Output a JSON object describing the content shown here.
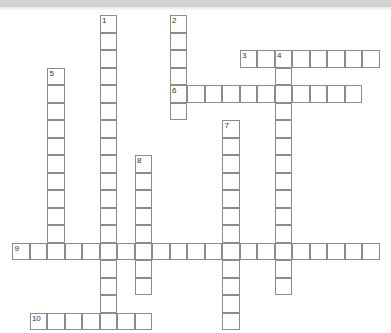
{
  "puzzle": {
    "title": "Crossword puzzle grid",
    "cell_size": 17.5,
    "origin": {
      "x": 12,
      "y": 15
    },
    "grid_columns": 22,
    "grid_rows": 18,
    "colors": {
      "cell_border": "#8c8c8c",
      "cell_fill": "#ffffff",
      "page_background": "#ffffff",
      "top_band": "#d4d4d4",
      "number_text": "#333333"
    },
    "entries": [
      {
        "number": "1",
        "direction": "down",
        "col": 5,
        "row": 0,
        "length": 18,
        "label": "clue-1-down"
      },
      {
        "number": "2",
        "direction": "down",
        "col": 9,
        "row": 0,
        "length": 6,
        "label": "clue-2-down"
      },
      {
        "number": "3",
        "direction": "across",
        "col": 13,
        "row": 2,
        "length": 8,
        "label": "clue-3-across"
      },
      {
        "number": "4",
        "direction": "down",
        "col": 15,
        "row": 2,
        "length": 14,
        "label": "clue-4-down"
      },
      {
        "number": "5",
        "direction": "down",
        "col": 2,
        "row": 3,
        "length": 11,
        "label": "clue-5-down"
      },
      {
        "number": "6",
        "direction": "across",
        "col": 9,
        "row": 4,
        "length": 11,
        "label": "clue-6-across"
      },
      {
        "number": "7",
        "direction": "down",
        "col": 12,
        "row": 6,
        "length": 12,
        "label": "clue-7-down"
      },
      {
        "number": "8",
        "direction": "down",
        "col": 7,
        "row": 8,
        "length": 8,
        "label": "clue-8-down"
      },
      {
        "number": "9",
        "direction": "across",
        "col": 0,
        "row": 13,
        "length": 21,
        "label": "clue-9-across"
      },
      {
        "number": "10",
        "direction": "across",
        "col": 1,
        "row": 17,
        "length": 7,
        "label": "clue-10-across"
      }
    ]
  }
}
